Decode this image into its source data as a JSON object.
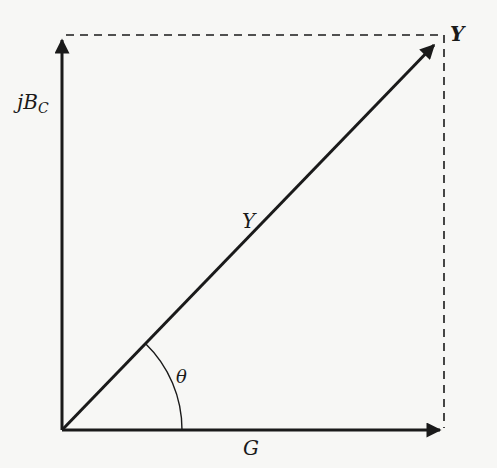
{
  "diagram": {
    "colors": {
      "ink": "#1a1a1a",
      "background": "#f7f7f5"
    },
    "labels": {
      "y_tip": "Y",
      "y_mid": "Y",
      "vertical_axis_main": "jB",
      "vertical_axis_sub": "C",
      "horizontal_axis": "G",
      "angle": "θ"
    },
    "vectors": [
      {
        "name": "G",
        "from": [
          62,
          430
        ],
        "to": [
          443,
          430
        ]
      },
      {
        "name": "jBC",
        "from": [
          62,
          430
        ],
        "to": [
          62,
          35
        ]
      },
      {
        "name": "Y",
        "from": [
          62,
          430
        ],
        "to": [
          437,
          42
        ]
      }
    ],
    "dashed_lines": [
      {
        "from": [
          62,
          35
        ],
        "to": [
          444,
          35
        ]
      },
      {
        "from": [
          444,
          35
        ],
        "to": [
          444,
          430
        ]
      }
    ],
    "angle_arc": {
      "center": [
        62,
        430
      ],
      "radius": 120
    }
  }
}
